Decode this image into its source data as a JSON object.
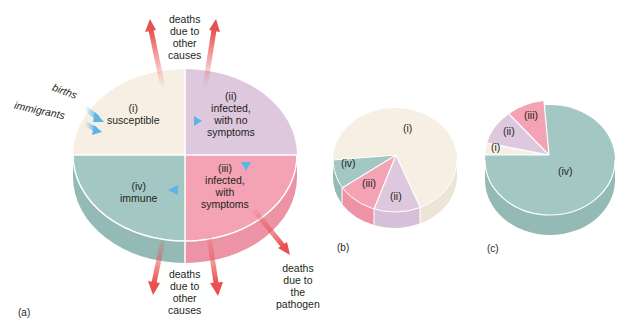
{
  "colors": {
    "susceptible": "#f7efe4",
    "infected_no_symptoms": "#ddc8de",
    "infected_symptoms": "#f3a3b3",
    "immune": "#a3c8c3",
    "flow_arrow": "#5bb5e8",
    "death_arrow": "#e8514f"
  },
  "diagram_a": {
    "panel_label": "(a)",
    "segments": [
      {
        "id": "i",
        "label_num": "(i)",
        "label": "susceptible"
      },
      {
        "id": "ii",
        "label_num": "(ii)",
        "label_lines": [
          "infected,",
          "with no",
          "symptoms"
        ]
      },
      {
        "id": "iii",
        "label_num": "(iii)",
        "label_lines": [
          "infected,",
          "with",
          "symptoms"
        ]
      },
      {
        "id": "iv",
        "label_num": "(iv)",
        "label": "immune"
      }
    ],
    "inflows": [
      "births",
      "immigrants"
    ],
    "top_deaths_lines": [
      "deaths",
      "due to",
      "other",
      "causes"
    ],
    "bottom_deaths_lines": [
      "deaths",
      "due to",
      "other",
      "causes"
    ],
    "pathogen_deaths_lines": [
      "deaths",
      "due to",
      "the",
      "pathogen"
    ]
  },
  "diagram_b": {
    "panel_label": "(b)",
    "segments": [
      "(i)",
      "(ii)",
      "(iii)",
      "(iv)"
    ]
  },
  "diagram_c": {
    "panel_label": "(c)",
    "segments": [
      "(i)",
      "(ii)",
      "(iii)",
      "(iv)"
    ]
  }
}
